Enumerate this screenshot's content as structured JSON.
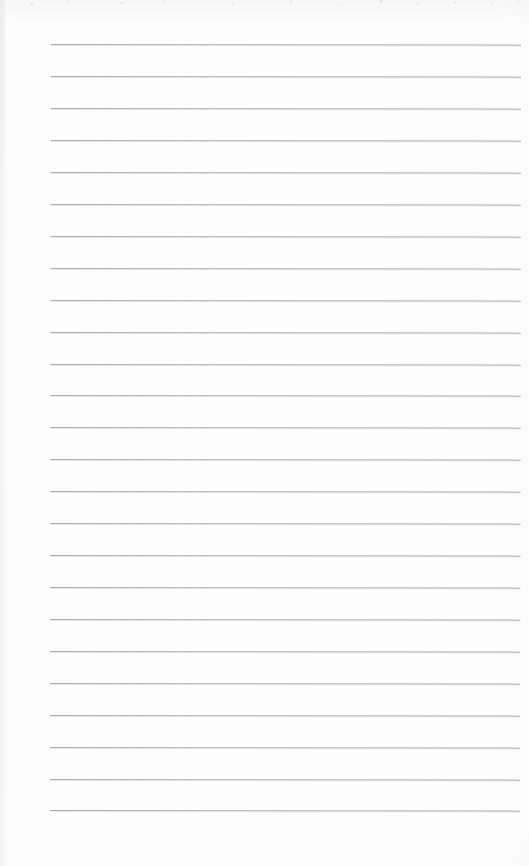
{
  "document": {
    "kind": "lined-notepad-page",
    "title": "Lined Notepad Page",
    "content_text": "",
    "written_content": "",
    "page_width": 529,
    "page_height": 866,
    "background_color": "#fdfdfd"
  },
  "ruling": {
    "line_color": "#a6a6a8",
    "line_thickness": 1,
    "line_count": 25,
    "line_left_x": 51,
    "line_right_x": 521,
    "line_length": 470,
    "first_line_y": 44,
    "last_line_y": 810,
    "line_spacing": 31.9,
    "left_margin": 51,
    "right_margin": 8,
    "top_margin": 44,
    "bottom_margin": 56,
    "lines": [
      {
        "index": 1,
        "y": 44
      },
      {
        "index": 2,
        "y": 76
      },
      {
        "index": 3,
        "y": 108
      },
      {
        "index": 4,
        "y": 140
      },
      {
        "index": 5,
        "y": 172
      },
      {
        "index": 6,
        "y": 204
      },
      {
        "index": 7,
        "y": 236
      },
      {
        "index": 8,
        "y": 268
      },
      {
        "index": 9,
        "y": 300
      },
      {
        "index": 10,
        "y": 332
      },
      {
        "index": 11,
        "y": 364
      },
      {
        "index": 12,
        "y": 395
      },
      {
        "index": 13,
        "y": 427
      },
      {
        "index": 14,
        "y": 459
      },
      {
        "index": 15,
        "y": 491
      },
      {
        "index": 16,
        "y": 523
      },
      {
        "index": 17,
        "y": 555
      },
      {
        "index": 18,
        "y": 587
      },
      {
        "index": 19,
        "y": 619
      },
      {
        "index": 20,
        "y": 651
      },
      {
        "index": 21,
        "y": 683
      },
      {
        "index": 22,
        "y": 715
      },
      {
        "index": 23,
        "y": 747
      },
      {
        "index": 24,
        "y": 779
      },
      {
        "index": 25,
        "y": 810
      }
    ]
  },
  "scan_artifacts": {
    "top_noise_band_height": 14,
    "left_edge_shadow_width": 5,
    "skew_degrees": 0.07
  }
}
